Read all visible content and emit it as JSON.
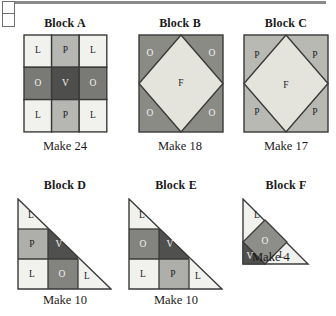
{
  "page": {
    "corner_fragment": "table-fragment",
    "blocks": [
      {
        "id": "a",
        "title": "Block A",
        "caption": "Make 24",
        "shape": "square-nine-patch",
        "patches": [
          {
            "letter": "L",
            "fill": "#f1f1ee",
            "tone": "light"
          },
          {
            "letter": "P",
            "fill": "#b6b6b2",
            "tone": "light"
          },
          {
            "letter": "L",
            "fill": "#f1f1ee",
            "tone": "light"
          },
          {
            "letter": "O",
            "fill": "#797975",
            "tone": "dark"
          },
          {
            "letter": "V",
            "fill": "#4e4e4c",
            "tone": "dark"
          },
          {
            "letter": "O",
            "fill": "#797975",
            "tone": "dark"
          },
          {
            "letter": "L",
            "fill": "#f1f1ee",
            "tone": "light"
          },
          {
            "letter": "P",
            "fill": "#b6b6b2",
            "tone": "light"
          },
          {
            "letter": "L",
            "fill": "#f1f1ee",
            "tone": "light"
          }
        ]
      },
      {
        "id": "b",
        "title": "Block B",
        "caption": "Make 18",
        "shape": "square-in-square",
        "center": {
          "letter": "F",
          "fill": "#e4e4dd",
          "tone": "light"
        },
        "corners": [
          {
            "letter": "O",
            "fill": "#8b8b86",
            "tone": "dark"
          },
          {
            "letter": "O",
            "fill": "#8b8b86",
            "tone": "dark"
          },
          {
            "letter": "O",
            "fill": "#8b8b86",
            "tone": "dark"
          },
          {
            "letter": "O",
            "fill": "#8b8b86",
            "tone": "dark"
          }
        ]
      },
      {
        "id": "c",
        "title": "Block C",
        "caption": "Make 17",
        "shape": "square-in-square",
        "center": {
          "letter": "F",
          "fill": "#e4e4dd",
          "tone": "light"
        },
        "corners": [
          {
            "letter": "P",
            "fill": "#b9b9b4",
            "tone": "light"
          },
          {
            "letter": "P",
            "fill": "#b9b9b4",
            "tone": "light"
          },
          {
            "letter": "P",
            "fill": "#b9b9b4",
            "tone": "light"
          },
          {
            "letter": "P",
            "fill": "#b9b9b4",
            "tone": "light"
          }
        ]
      },
      {
        "id": "d",
        "title": "Block D",
        "caption": "Make 10",
        "shape": "half-square-triangle-nine-patch",
        "patches": [
          {
            "letter": "L",
            "fill": "#f1f1ee",
            "tone": "light"
          },
          {
            "letter": "P",
            "fill": "#aeaeaa",
            "tone": "light"
          },
          {
            "letter": "V",
            "fill": "#50504e",
            "tone": "dark"
          },
          {
            "letter": "L",
            "fill": "#f1f1ee",
            "tone": "light"
          },
          {
            "letter": "O",
            "fill": "#838380",
            "tone": "dark"
          },
          {
            "letter": "L",
            "fill": "#f1f1ee",
            "tone": "light"
          }
        ]
      },
      {
        "id": "e",
        "title": "Block E",
        "caption": "Make 10",
        "shape": "half-square-triangle-nine-patch",
        "patches": [
          {
            "letter": "L",
            "fill": "#f1f1ee",
            "tone": "light"
          },
          {
            "letter": "O",
            "fill": "#838380",
            "tone": "dark"
          },
          {
            "letter": "V",
            "fill": "#50504e",
            "tone": "dark"
          },
          {
            "letter": "L",
            "fill": "#f1f1ee",
            "tone": "light"
          },
          {
            "letter": "P",
            "fill": "#aeaeaa",
            "tone": "light"
          },
          {
            "letter": "L",
            "fill": "#f1f1ee",
            "tone": "light"
          }
        ]
      },
      {
        "id": "f",
        "title": "Block F",
        "caption": "Make 4",
        "shape": "triangle-with-center-diamond",
        "patches": [
          {
            "letter": "L",
            "fill": "#f1f1ee",
            "tone": "light"
          },
          {
            "letter": "O",
            "fill": "#8d8d89",
            "tone": "dark"
          },
          {
            "letter": "V",
            "fill": "#50504e",
            "tone": "dark"
          },
          {
            "letter": "L",
            "fill": "#f1f1ee",
            "tone": "light"
          }
        ]
      }
    ]
  },
  "colors": {
    "outline": "#3a3a3a",
    "light_patch": "#f1f1ee",
    "medium_patch": "#b6b6b2",
    "dark_patch": "#797975",
    "darkest_patch": "#4e4e4c",
    "background": "#ffffff"
  }
}
